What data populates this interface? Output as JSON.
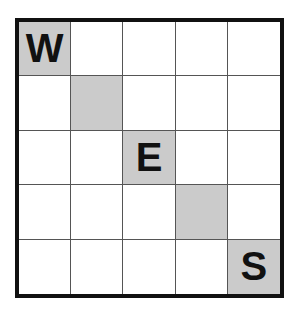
{
  "puzzle": {
    "rows": 5,
    "cols": 5,
    "shade_color": "#cbcbcb",
    "grid": [
      [
        {
          "letter": "W",
          "shaded": true
        },
        {
          "letter": "",
          "shaded": false
        },
        {
          "letter": "",
          "shaded": false
        },
        {
          "letter": "",
          "shaded": false
        },
        {
          "letter": "",
          "shaded": false
        }
      ],
      [
        {
          "letter": "",
          "shaded": false
        },
        {
          "letter": "",
          "shaded": true
        },
        {
          "letter": "",
          "shaded": false
        },
        {
          "letter": "",
          "shaded": false
        },
        {
          "letter": "",
          "shaded": false
        }
      ],
      [
        {
          "letter": "",
          "shaded": false
        },
        {
          "letter": "",
          "shaded": false
        },
        {
          "letter": "E",
          "shaded": true
        },
        {
          "letter": "",
          "shaded": false
        },
        {
          "letter": "",
          "shaded": false
        }
      ],
      [
        {
          "letter": "",
          "shaded": false
        },
        {
          "letter": "",
          "shaded": false
        },
        {
          "letter": "",
          "shaded": false
        },
        {
          "letter": "",
          "shaded": true
        },
        {
          "letter": "",
          "shaded": false
        }
      ],
      [
        {
          "letter": "",
          "shaded": false
        },
        {
          "letter": "",
          "shaded": false
        },
        {
          "letter": "",
          "shaded": false
        },
        {
          "letter": "",
          "shaded": false
        },
        {
          "letter": "S",
          "shaded": true
        }
      ]
    ]
  }
}
